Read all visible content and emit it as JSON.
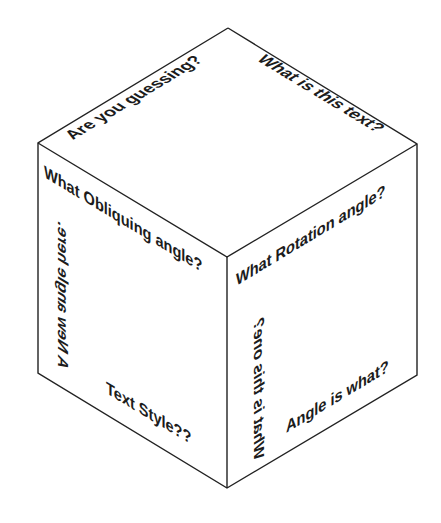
{
  "diagram": {
    "type": "isometric-cube-text-labels",
    "colors": {
      "background": "#ffffff",
      "edge": "#222222",
      "text": "#1c1c1c"
    },
    "faces": {
      "top": {
        "labels": [
          "Are you guessing?",
          "What is this text?"
        ]
      },
      "left": {
        "labels": [
          "What Obliquing angle?",
          "A New angle here.",
          "Text Style??"
        ]
      },
      "right": {
        "labels": [
          "What Rotation angle?",
          "What is this one?",
          "Angle is what?"
        ]
      }
    }
  }
}
